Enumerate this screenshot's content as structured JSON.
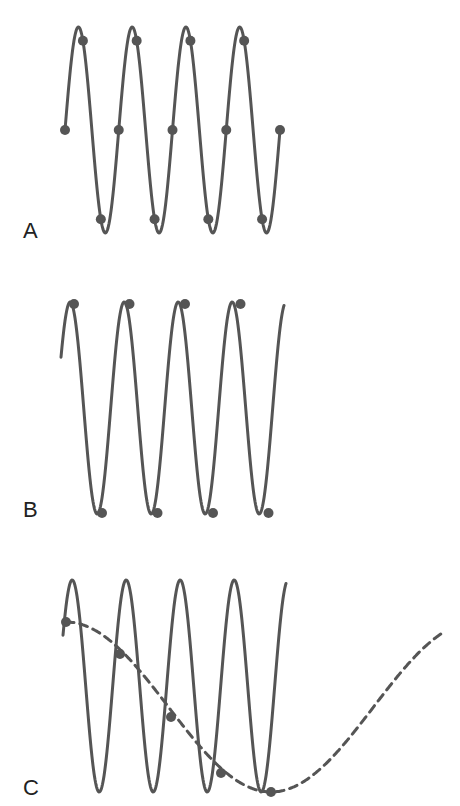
{
  "colors": {
    "wave": "#555555",
    "dot": "#555555",
    "label": "#222222"
  },
  "panels": [
    {
      "label": "A",
      "description": "High-frequency sine sampled at many points (adequate sampling)"
    },
    {
      "label": "B",
      "description": "Same sine sampled only at peaks and troughs (Nyquist rate)"
    },
    {
      "label": "C",
      "description": "Sine undersampled; samples trace a lower-frequency alias (dashed)"
    }
  ]
}
